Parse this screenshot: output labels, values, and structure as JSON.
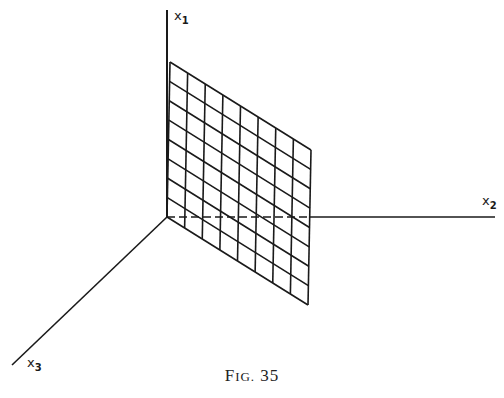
{
  "figure": {
    "caption_prefix_big": "F",
    "caption_prefix_small": "IG.",
    "caption_number": "35",
    "axes": {
      "x1": {
        "label": "x",
        "subscript": "1"
      },
      "x2": {
        "label": "x",
        "subscript": "2"
      },
      "x3": {
        "label": "x",
        "subscript": "3"
      }
    },
    "grid": {
      "rows": 8,
      "cols": 8,
      "corners": {
        "top_left": [
          170,
          62
        ],
        "top_right": [
          311,
          150
        ],
        "bottom_left": [
          167,
          217
        ],
        "bottom_right": [
          308,
          305
        ]
      }
    },
    "colors": {
      "ink": "#1a1a1a",
      "background": "#ffffff"
    }
  }
}
